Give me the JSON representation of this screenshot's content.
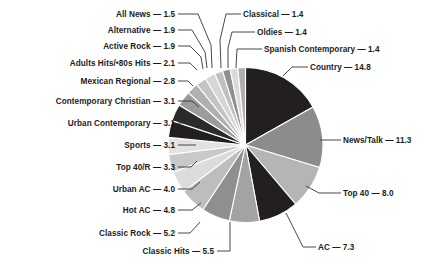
{
  "chart_data": {
    "type": "pie",
    "title": "",
    "subtitle": "",
    "xlabel": "",
    "ylabel": "",
    "legend_position": "none",
    "labels_style": "leader-lines",
    "value_suffix": "",
    "separator": "—",
    "categories": [
      "Country",
      "News/Talk",
      "Top 40",
      "AC",
      "Classic Hits",
      "Classic Rock",
      "Hot AC",
      "Urban AC",
      "Top 40/R",
      "Sports",
      "Urban Contemporary",
      "Contemporary Christian",
      "Mexican Regional",
      "Adults Hits/•80s Hits",
      "Active Rock",
      "Alternative",
      "All News",
      "Classical",
      "Oldies",
      "Spanish Contemporary"
    ],
    "values": [
      14.8,
      11.3,
      8.0,
      7.3,
      5.5,
      5.2,
      4.8,
      4.0,
      3.3,
      3.1,
      3.1,
      3.1,
      2.8,
      2.1,
      1.9,
      1.9,
      1.5,
      1.4,
      1.4,
      1.4
    ],
    "colors": [
      "#231f20",
      "#8c8c8c",
      "#b5b5b5",
      "#231f20",
      "#a3a3a3",
      "#8f8f8f",
      "#bdbdbd",
      "#dcdcdc",
      "#c9c9c9",
      "#e2e2e2",
      "#231f20",
      "#2b2b2b",
      "#9b9b9b",
      "#b0b0b0",
      "#c4c4c4",
      "#d6d6d6",
      "#bfbfbf",
      "#8f8f8f",
      "#dadada",
      "#aeaeae"
    ]
  },
  "labels": [
    {
      "name": "all-news",
      "text": "All News — 1.5",
      "side": "left",
      "x": 175,
      "y": 17
    },
    {
      "name": "alternative",
      "text": "Alternative — 1.9",
      "side": "left",
      "x": 175,
      "y": 33
    },
    {
      "name": "active-rock",
      "text": "Active Rock — 1.9",
      "side": "left",
      "x": 175,
      "y": 49
    },
    {
      "name": "adults-hits-80s-hits",
      "text": "Adults Hits/•80s Hits — 2.1",
      "side": "left",
      "x": 175,
      "y": 66
    },
    {
      "name": "mexican-regional",
      "text": "Mexican Regional — 2.8",
      "side": "left",
      "x": 175,
      "y": 84
    },
    {
      "name": "contemporary-christian",
      "text": "Contemporary Christian — 3.1",
      "side": "left",
      "x": 175,
      "y": 104
    },
    {
      "name": "urban-contemporary",
      "text": "Urban Contemporary — 3.1",
      "side": "left",
      "x": 175,
      "y": 126
    },
    {
      "name": "sports",
      "text": "Sports — 3.1",
      "side": "left",
      "x": 175,
      "y": 148
    },
    {
      "name": "top-40-r",
      "text": "Top 40/R — 3.3",
      "side": "left",
      "x": 175,
      "y": 170
    },
    {
      "name": "urban-ac",
      "text": "Urban AC — 4.0",
      "side": "left",
      "x": 175,
      "y": 192
    },
    {
      "name": "hot-ac",
      "text": "Hot AC — 4.8",
      "side": "left",
      "x": 175,
      "y": 213
    },
    {
      "name": "classic-rock",
      "text": "Classic Rock — 5.2",
      "side": "left",
      "x": 175,
      "y": 236
    },
    {
      "name": "classic-hits",
      "text": "Classic Hits — 5.5",
      "side": "left",
      "x": 214,
      "y": 254
    },
    {
      "name": "classical",
      "text": "Classical — 1.4",
      "side": "right",
      "x": 243,
      "y": 17
    },
    {
      "name": "oldies",
      "text": "Oldies — 1.4",
      "side": "right",
      "x": 257,
      "y": 35
    },
    {
      "name": "spanish-contemporary",
      "text": "Spanish Contemporary — 1.4",
      "side": "right",
      "x": 264,
      "y": 52
    },
    {
      "name": "country",
      "text": "Country — 14.8",
      "side": "right",
      "x": 310,
      "y": 70
    },
    {
      "name": "news-talk",
      "text": "News/Talk — 11.3",
      "side": "right",
      "x": 343,
      "y": 143
    },
    {
      "name": "top-40",
      "text": "Top 40 — 8.0",
      "side": "right",
      "x": 343,
      "y": 196
    },
    {
      "name": "ac",
      "text": "AC — 7.3",
      "side": "right",
      "x": 318,
      "y": 250
    }
  ],
  "leaders": [
    {
      "name": "leader-all-news",
      "d": "M178,14 L198,14 L211,45 L212,68"
    },
    {
      "name": "leader-alternative",
      "d": "M178,30 L192,30 L205,52 L207,68"
    },
    {
      "name": "leader-active-rock",
      "d": "M178,46 L190,46 L201,57 L203,69"
    },
    {
      "name": "leader-adults-hits",
      "d": "M178,63 L190,63 L197,70"
    },
    {
      "name": "leader-mexican-regional",
      "d": "M178,81 L188,81 L193,86"
    },
    {
      "name": "leader-contemporary-christian",
      "d": "M178,101 L192,101 L199,107"
    },
    {
      "name": "leader-urban-contemporary",
      "d": "M178,123 L196,123"
    },
    {
      "name": "leader-sports",
      "d": "M178,145 L196,145"
    },
    {
      "name": "leader-top-40-r",
      "d": "M178,167 L191,167 L197,161"
    },
    {
      "name": "leader-urban-ac",
      "d": "M178,189 L192,189 L200,182"
    },
    {
      "name": "leader-hot-ac",
      "d": "M178,210 L192,210 L201,203"
    },
    {
      "name": "leader-classic-rock",
      "d": "M178,233 L190,233 L200,222"
    },
    {
      "name": "leader-classic-hits",
      "d": "M217,251 L230,251 L230,222"
    },
    {
      "name": "leader-classical",
      "d": "M241,14 L226,14 L220,40 L221,68"
    },
    {
      "name": "leader-oldies",
      "d": "M255,32 L232,32 L228,48 L228,68"
    },
    {
      "name": "leader-spanish-contemporary",
      "d": "M262,49 L237,49 L236,68"
    },
    {
      "name": "leader-country",
      "d": "M308,67 L292,67 L283,76"
    },
    {
      "name": "leader-news-talk",
      "d": "M341,140 L320,140"
    },
    {
      "name": "leader-top-40",
      "d": "M341,193 L319,193 L306,186"
    },
    {
      "name": "leader-ac",
      "d": "M316,247 L303,247 L286,213"
    }
  ]
}
